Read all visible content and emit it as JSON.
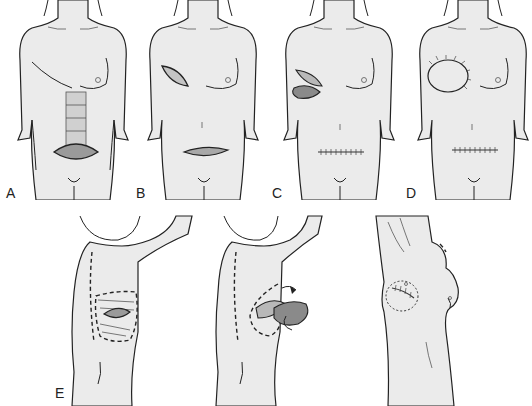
{
  "figure": {
    "panels": [
      {
        "id": "A",
        "label": "A",
        "view": "front",
        "description": "Vertical rectus abdominis flap outlined with transverse lower abdominal skin island"
      },
      {
        "id": "B",
        "label": "B",
        "view": "front",
        "description": "Chest wall defect on right breast region with lower abdominal incision"
      },
      {
        "id": "C",
        "label": "C",
        "view": "front",
        "description": "Flap tunneled and inset into chest defect; lower abdominal closure sutured"
      },
      {
        "id": "D",
        "label": "D",
        "view": "front",
        "description": "Flap sutured into chest defect; abdominal incision closed"
      },
      {
        "id": "E",
        "label": "E",
        "view": "back/side",
        "description": "Latissimus dorsi flap: outline on back, rotation to chest, final inset"
      }
    ],
    "labels": {
      "a": "A",
      "b": "B",
      "c": "C",
      "d": "D",
      "e": "E"
    },
    "colors": {
      "skin": "#ebebeb",
      "outline": "#222222",
      "background": "#ffffff"
    }
  }
}
